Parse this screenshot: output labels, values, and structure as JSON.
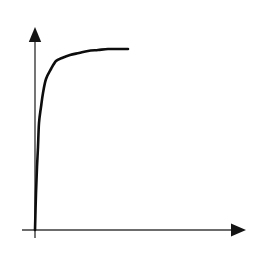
{
  "figure": {
    "width": 259,
    "height": 256,
    "background_color": "#ffffff",
    "title": "",
    "caption": ""
  },
  "colors": {
    "axis": "#3b3b3b",
    "arrowhead": "#141414",
    "curve": "#0d0d0d",
    "background": "#ffffff"
  },
  "axes": {
    "origin": {
      "x": 35,
      "y": 230
    },
    "x_axis": {
      "label": "",
      "tick_labels": [],
      "start_px": {
        "x": 22,
        "y": 230
      },
      "end_px": {
        "x": 236,
        "y": 230
      },
      "arrow_tip_px": {
        "x": 246,
        "y": 230
      },
      "arrow_direction": "right"
    },
    "y_axis": {
      "label": "",
      "tick_labels": [],
      "start_px": {
        "x": 35,
        "y": 237
      },
      "end_px": {
        "x": 35,
        "y": 35
      },
      "arrow_tip_px": {
        "x": 35,
        "y": 27
      },
      "arrow_direction": "up"
    }
  },
  "chart_data": {
    "type": "line",
    "title": "",
    "subtitle": "",
    "xlabel": "",
    "ylabel": "",
    "grid": false,
    "legend_position": "none",
    "legend_entries": [],
    "annotations": [],
    "xlim": [
      0,
      1
    ],
    "ylim": [
      0,
      1
    ],
    "shape_description": "monotonically increasing concave saturating curve rising steeply from the origin then flattening to a horizontal plateau",
    "series": [
      {
        "name": "saturating curve",
        "color": "#0d0d0d",
        "x": [
          0.0,
          0.01,
          0.02,
          0.03,
          0.05,
          0.07,
          0.1,
          0.14,
          0.18,
          0.23,
          0.29,
          0.36,
          0.44,
          0.52,
          0.61,
          0.7,
          0.79,
          0.87,
          0.93,
          0.97,
          1.0
        ],
        "y": [
          0.0,
          0.18,
          0.31,
          0.41,
          0.53,
          0.61,
          0.68,
          0.75,
          0.8,
          0.84,
          0.875,
          0.905,
          0.928,
          0.946,
          0.96,
          0.972,
          0.981,
          0.988,
          0.993,
          0.997,
          1.0
        ]
      }
    ],
    "pixel_points": [
      {
        "x": 35,
        "y": 230
      },
      {
        "x": 36,
        "y": 193
      },
      {
        "x": 37,
        "y": 167
      },
      {
        "x": 38,
        "y": 147
      },
      {
        "x": 39,
        "y": 123
      },
      {
        "x": 41,
        "y": 107
      },
      {
        "x": 43,
        "y": 93
      },
      {
        "x": 46,
        "y": 79
      },
      {
        "x": 51,
        "y": 69
      },
      {
        "x": 56,
        "y": 61
      },
      {
        "x": 62,
        "y": 58
      },
      {
        "x": 70,
        "y": 55
      },
      {
        "x": 79,
        "y": 53
      },
      {
        "x": 88,
        "y": 51
      },
      {
        "x": 98,
        "y": 50
      },
      {
        "x": 108,
        "y": 49
      },
      {
        "x": 117,
        "y": 49
      },
      {
        "x": 124,
        "y": 49
      },
      {
        "x": 128,
        "y": 49
      }
    ]
  }
}
